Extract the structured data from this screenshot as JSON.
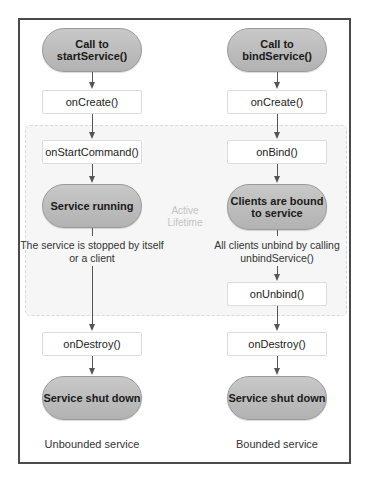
{
  "diagram": {
    "active_region_label": "Active Lifetime",
    "left_column": {
      "start": "Call to startService()",
      "on_create": "onCreate()",
      "on_start_command": "onStartCommand()",
      "running": "Service running",
      "stop_note": "The service is stopped by itself or a client",
      "on_destroy": "onDestroy()",
      "end": "Service shut down",
      "caption": "Unbounded service"
    },
    "right_column": {
      "start": "Call to bindService()",
      "on_create": "onCreate()",
      "on_bind": "onBind()",
      "bound": "Clients are bound to service",
      "unbind_note": "All clients unbind by calling unbindService()",
      "on_unbind": "onUnbind()",
      "on_destroy": "onDestroy()",
      "end": "Service shut down",
      "caption": "Bounded service"
    },
    "colors": {
      "frame": "#4a4a4a",
      "pill_fill": "#bdbdbd",
      "box_border": "#dcdcdc",
      "active_region_fill": "#f6f6f6",
      "arrow": "#555555"
    }
  }
}
